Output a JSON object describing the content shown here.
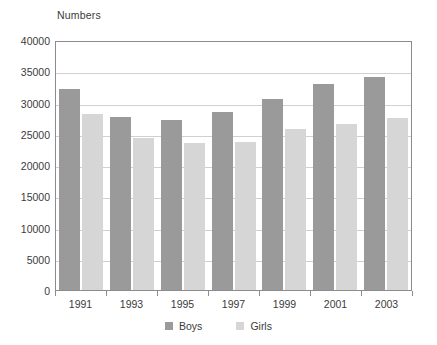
{
  "chart_data": {
    "type": "bar",
    "title": "",
    "axis_title": "Numbers",
    "xlabel": "",
    "ylabel": "Numbers",
    "categories": [
      "1991",
      "1993",
      "1995",
      "1997",
      "1999",
      "2001",
      "2003"
    ],
    "series": [
      {
        "name": "Boys",
        "color": "#9a9a9a",
        "values": [
          32200,
          27700,
          27200,
          28500,
          30600,
          33000,
          34100
        ]
      },
      {
        "name": "Girls",
        "color": "#d6d6d6",
        "values": [
          28200,
          24400,
          23500,
          23700,
          25800,
          26600,
          27600
        ]
      }
    ],
    "ylim": [
      0,
      40000
    ],
    "y_ticks": [
      40000,
      35000,
      30000,
      25000,
      20000,
      15000,
      10000,
      5000,
      0
    ],
    "y_tick_labels": [
      "40000",
      "35000",
      "30000",
      "25000",
      "20000",
      "15000",
      "10000",
      "5000",
      "0"
    ],
    "grid": "horizontal",
    "legend_position": "bottom",
    "legend": [
      "Boys",
      "Girls"
    ]
  }
}
